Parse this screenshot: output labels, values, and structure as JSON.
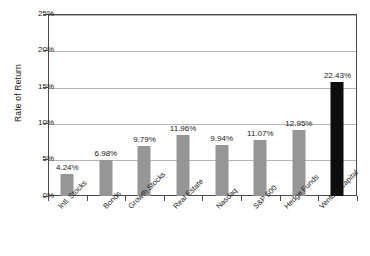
{
  "chart_data": {
    "type": "bar",
    "title": "",
    "xlabel": "",
    "ylabel": "Rate of Return",
    "ylim": [
      0,
      25
    ],
    "yticks": [
      "0%",
      "5%",
      "10%",
      "15%",
      "20%",
      "25%"
    ],
    "ytick_values": [
      0,
      5,
      10,
      15,
      20,
      25
    ],
    "grid": true,
    "legend": "none",
    "categories": [
      "Intl. Stocks",
      "Bonds",
      "Growth Stocks",
      "Real Estate",
      "Nasdaq",
      "S&P 500",
      "Hedge Funds",
      "Venture Capital"
    ],
    "values": [
      4.24,
      6.98,
      9.79,
      11.96,
      9.94,
      11.07,
      12.95,
      22.43
    ],
    "data_labels": [
      "4.24%",
      "6.98%",
      "9.79%",
      "11.96%",
      "9.94%",
      "11.07%",
      "12.95%",
      "22.43%"
    ],
    "bar_colors": [
      "#969696",
      "#969696",
      "#969696",
      "#969696",
      "#969696",
      "#969696",
      "#969696",
      "#0d0d0d"
    ],
    "plot_frame_color": "#4a4a4a",
    "gridline_color": "#b5b5b5",
    "background_color": "#ffffff"
  }
}
